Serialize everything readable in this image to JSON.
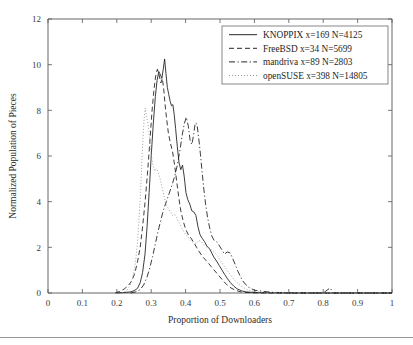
{
  "chart_data": {
    "type": "line",
    "title": "",
    "xlabel": "Proportion of Downloaders",
    "ylabel": "Normalized Population of Pieces",
    "xlim": [
      0,
      1
    ],
    "ylim": [
      0,
      12
    ],
    "xticks": [
      0,
      0.1,
      0.2,
      0.3,
      0.4,
      0.5,
      0.6,
      0.7,
      0.8,
      0.9,
      1
    ],
    "xticklabels": [
      "0",
      "0.1",
      "0.2",
      "0.3",
      "0.4",
      "0.5",
      "0.6",
      "0.7",
      "0.8",
      "0.9",
      "1"
    ],
    "yticks": [
      0,
      2,
      4,
      6,
      8,
      10,
      12
    ],
    "yticklabels": [
      "0",
      "2",
      "4",
      "6",
      "8",
      "10",
      "12"
    ],
    "grid": false,
    "legend_position": "upper-right",
    "series": [
      {
        "name": "KNOPPIX",
        "label": "KNOPPIX x=169 N=4125",
        "x_count": 169,
        "n_count": 4125,
        "style": "solid",
        "color": "#1a1a1a",
        "x": [
          0.2,
          0.22,
          0.24,
          0.25,
          0.26,
          0.268,
          0.275,
          0.282,
          0.288,
          0.294,
          0.3,
          0.306,
          0.312,
          0.317,
          0.322,
          0.327,
          0.331,
          0.335,
          0.339,
          0.343,
          0.347,
          0.351,
          0.355,
          0.359,
          0.363,
          0.367,
          0.371,
          0.376,
          0.381,
          0.386,
          0.391,
          0.396,
          0.401,
          0.406,
          0.412,
          0.418,
          0.424,
          0.43,
          0.436,
          0.442,
          0.448,
          0.455,
          0.462,
          0.469,
          0.476,
          0.483,
          0.49,
          0.498,
          0.506,
          0.514,
          0.522,
          0.53,
          0.54,
          0.55,
          0.562,
          0.575,
          0.6,
          0.65,
          0.7,
          0.8,
          0.9,
          1.0
        ],
        "y": [
          0.0,
          0.02,
          0.05,
          0.1,
          0.2,
          0.45,
          0.9,
          1.7,
          2.9,
          4.4,
          6.0,
          7.4,
          8.6,
          9.3,
          9.7,
          9.55,
          9.4,
          9.8,
          10.25,
          9.6,
          9.0,
          8.7,
          8.4,
          8.2,
          8.25,
          7.8,
          7.2,
          6.4,
          5.7,
          5.4,
          5.6,
          5.1,
          4.4,
          4.1,
          3.9,
          3.6,
          3.55,
          3.4,
          2.9,
          2.55,
          2.4,
          2.25,
          2.05,
          1.95,
          1.75,
          1.55,
          1.4,
          1.2,
          1.0,
          0.8,
          0.62,
          0.46,
          0.3,
          0.18,
          0.1,
          0.05,
          0.02,
          0.01,
          0.0,
          0.0,
          0.0,
          0.0
        ]
      },
      {
        "name": "FreeBSD",
        "label": "FreeBSD x=34 N=5699",
        "x_count": 34,
        "n_count": 5699,
        "style": "dashed",
        "color": "#1a1a1a",
        "x": [
          0.195,
          0.21,
          0.222,
          0.233,
          0.243,
          0.252,
          0.26,
          0.268,
          0.275,
          0.282,
          0.289,
          0.296,
          0.302,
          0.308,
          0.313,
          0.318,
          0.323,
          0.328,
          0.332,
          0.336,
          0.34,
          0.345,
          0.35,
          0.356,
          0.362,
          0.368,
          0.374,
          0.38,
          0.386,
          0.393,
          0.4,
          0.408,
          0.416,
          0.424,
          0.432,
          0.44,
          0.448,
          0.456,
          0.464,
          0.472,
          0.48,
          0.49,
          0.5,
          0.51,
          0.52,
          0.532,
          0.545,
          0.558,
          0.572,
          0.59,
          0.62,
          0.7,
          0.8,
          1.0
        ],
        "y": [
          0.0,
          0.08,
          0.18,
          0.32,
          0.52,
          0.85,
          1.35,
          2.0,
          2.9,
          3.95,
          5.2,
          6.6,
          7.9,
          8.9,
          9.5,
          9.8,
          9.55,
          9.2,
          9.4,
          9.0,
          8.3,
          7.6,
          7.0,
          6.55,
          6.2,
          5.6,
          4.9,
          4.2,
          3.6,
          3.15,
          2.8,
          2.55,
          2.4,
          2.2,
          2.0,
          1.8,
          1.62,
          1.48,
          1.35,
          1.2,
          1.05,
          0.88,
          0.7,
          0.52,
          0.36,
          0.22,
          0.12,
          0.06,
          0.03,
          0.01,
          0.0,
          0.0,
          0.0,
          0.0
        ]
      },
      {
        "name": "mandriva",
        "label": "mandriva x=89 N=2803",
        "x_count": 89,
        "n_count": 2803,
        "style": "dashdot",
        "color": "#1a1a1a",
        "x": [
          0.24,
          0.255,
          0.268,
          0.278,
          0.288,
          0.296,
          0.304,
          0.312,
          0.32,
          0.328,
          0.336,
          0.344,
          0.352,
          0.36,
          0.368,
          0.376,
          0.384,
          0.39,
          0.396,
          0.402,
          0.408,
          0.413,
          0.418,
          0.423,
          0.428,
          0.433,
          0.438,
          0.443,
          0.448,
          0.453,
          0.458,
          0.464,
          0.47,
          0.476,
          0.483,
          0.49,
          0.497,
          0.505,
          0.513,
          0.521,
          0.53,
          0.54,
          0.552,
          0.565,
          0.58,
          0.6,
          0.65,
          0.7,
          0.8,
          0.82,
          0.83,
          0.9,
          1.0
        ],
        "y": [
          0.0,
          0.05,
          0.15,
          0.35,
          0.7,
          1.1,
          1.6,
          2.15,
          2.7,
          3.2,
          3.65,
          4.0,
          4.35,
          4.7,
          5.1,
          5.6,
          6.3,
          6.9,
          7.4,
          7.7,
          7.3,
          6.7,
          6.5,
          6.9,
          7.45,
          7.4,
          6.8,
          6.1,
          5.3,
          4.55,
          3.9,
          3.3,
          2.85,
          2.5,
          2.3,
          2.25,
          2.1,
          1.9,
          1.7,
          1.8,
          1.75,
          1.4,
          0.95,
          0.55,
          0.28,
          0.12,
          0.03,
          0.01,
          0.0,
          0.22,
          0.0,
          0.0,
          0.0
        ]
      },
      {
        "name": "openSUSE",
        "label": "openSUSE x=398 N=14805",
        "x_count": 398,
        "n_count": 14805,
        "style": "dotted",
        "color": "#8e8e8e",
        "x": [
          0.215,
          0.228,
          0.238,
          0.246,
          0.253,
          0.259,
          0.264,
          0.269,
          0.273,
          0.277,
          0.28,
          0.283,
          0.286,
          0.289,
          0.292,
          0.296,
          0.3,
          0.305,
          0.31,
          0.315,
          0.32,
          0.326,
          0.332,
          0.338,
          0.344,
          0.35,
          0.356,
          0.362,
          0.368,
          0.374,
          0.38,
          0.387,
          0.394,
          0.401,
          0.408,
          0.415,
          0.422,
          0.43,
          0.438,
          0.446,
          0.454,
          0.462,
          0.47,
          0.478,
          0.486,
          0.494,
          0.502,
          0.511,
          0.52,
          0.53,
          0.54,
          0.552,
          0.565,
          0.58,
          0.6,
          0.63,
          0.68,
          0.75,
          0.85,
          1.0
        ],
        "y": [
          0.0,
          0.1,
          0.3,
          0.65,
          1.2,
          2.0,
          3.1,
          4.4,
          5.8,
          7.0,
          7.75,
          8.1,
          7.8,
          7.55,
          7.3,
          6.6,
          6.1,
          5.6,
          5.35,
          5.45,
          5.3,
          5.0,
          4.6,
          4.2,
          3.85,
          3.7,
          3.55,
          3.4,
          3.45,
          3.3,
          3.1,
          2.9,
          2.7,
          2.55,
          2.45,
          2.3,
          2.2,
          2.15,
          2.3,
          2.25,
          2.1,
          2.0,
          1.95,
          1.85,
          1.75,
          1.6,
          1.4,
          1.2,
          1.0,
          0.8,
          0.6,
          0.42,
          0.26,
          0.14,
          0.06,
          0.02,
          0.01,
          0.0,
          0.0,
          0.0
        ]
      }
    ]
  },
  "axes": {
    "xlabel": "Proportion of Downloaders",
    "ylabel": "Normalized Population of Pieces"
  }
}
